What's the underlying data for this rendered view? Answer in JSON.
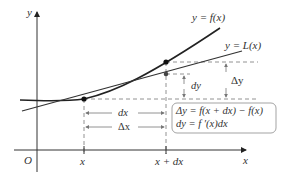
{
  "diagram": {
    "axes": {
      "x_label": "x",
      "y_label": "y",
      "origin_label": "O"
    },
    "curves": {
      "f_label": "y = f(x)",
      "L_label": "y = L(x)"
    },
    "ticks": {
      "x": "x",
      "x_plus_dx": "x + dx"
    },
    "measures": {
      "dx": "dx",
      "delta_x": "Δx",
      "dy": "dy",
      "delta_y": "Δy"
    },
    "box": {
      "line1": "Δy = f(x + dx) − f(x)",
      "line2": "dy = f ′(x)dx"
    },
    "colors": {
      "curve": "#222222",
      "tangent": "#444444",
      "dash": "#777777",
      "box_border": "#999999",
      "text": "#333333"
    }
  }
}
